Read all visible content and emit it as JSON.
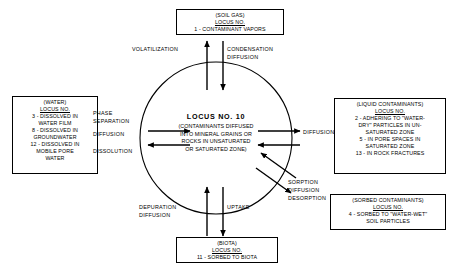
{
  "diagram": {
    "center": {
      "title": "LOCUS  NO.  10",
      "subtitle": "(CONTAMINANTS DIFFUSED\nINTO MINERAL GRAINS OR\nROCKS IN UNSATURATED\nOR SATURATED ZONE)"
    },
    "boxes": {
      "soil_gas": {
        "header": "(SOIL GAS)",
        "locus_label": "LOCUS NO.",
        "items": [
          "1 - CONTAMINANT VAPORS"
        ]
      },
      "water": {
        "header": "(WATER)",
        "locus_label": "LOCUS NO.",
        "items": [
          "3 - DISSOLVED IN\nWATER FILM",
          "8 - DISSOLVED IN\nGROUNDWATER",
          "12 - DISSOLVED IN\nMOBILE PORE\nWATER"
        ]
      },
      "liquid_contaminants": {
        "header": "(LIQUID CONTAMINANTS)",
        "locus_label": "LOCUS NO.",
        "items": [
          "2 - ADHERING TO \"WATER-\nDRY\" PARTICLES IN UN-\nSATURATED ZONE",
          "5 - IN PORE SPACES IN\nSATURATED ZONE",
          "13 - IN ROCK FRACTURES"
        ]
      },
      "sorbed_contaminants": {
        "header": "(SORBED CONTAMINANTS)",
        "locus_label": "LOCUS NO.",
        "items": [
          "4 -  SORBED TO \"WATER-WET\"\nSOIL PARTICLES"
        ]
      },
      "biota": {
        "header": "(BIOTA)",
        "locus_label": "LOCUS NO.",
        "items": [
          "11 - SORBED TO BIOTA"
        ]
      }
    },
    "process_labels": {
      "volatilization": "VOLATILIZATION",
      "condensation_diffusion": "CONDENSATION\nDIFFUSION",
      "phase_separation": "PHASE\nSEPARATION",
      "diffusion_left": "DIFFUSION",
      "dissolution": "DISSOLUTION",
      "diffusion_right": "DIFFUSION",
      "sorption_diffusion_desorption": "SORPTION\nDIFFUSION\nDESORPTION",
      "depuration_diffusion": "DEPURATION\nDIFFUSION",
      "uptake": "UPTAKE"
    },
    "colors": {
      "stroke": "#000000",
      "background": "#ffffff"
    }
  }
}
